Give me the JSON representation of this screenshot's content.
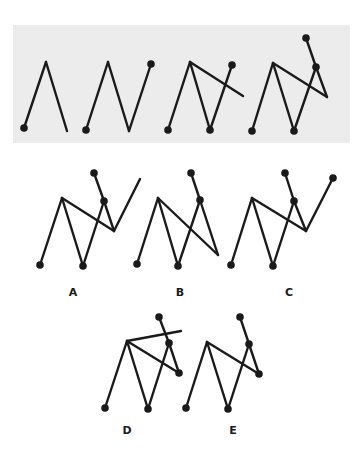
{
  "puzzle": {
    "type": "sequence-completion",
    "sequence_panel": {
      "background": "#ececec",
      "x": 13,
      "y": 25,
      "width": 337,
      "height": 118,
      "figures": [
        {
          "id": "step-1",
          "segments": [
            [
              24,
              128,
              46,
              62
            ],
            [
              46,
              62,
              67,
              131
            ]
          ],
          "dots": [
            [
              24,
              128
            ]
          ]
        },
        {
          "id": "step-2",
          "segments": [
            [
              86,
              130,
              108,
              62
            ],
            [
              108,
              62,
              129,
              131
            ],
            [
              129,
              131,
              151,
              64
            ]
          ],
          "dots": [
            [
              86,
              130
            ],
            [
              151,
              64
            ]
          ]
        },
        {
          "id": "step-3",
          "segments": [
            [
              168,
              130,
              190,
              62
            ],
            [
              190,
              62,
              210,
              130
            ],
            [
              210,
              130,
              232,
              65
            ],
            [
              190,
              62,
              243,
              96
            ]
          ],
          "dots": [
            [
              168,
              130
            ],
            [
              210,
              130
            ],
            [
              232,
              65
            ]
          ]
        },
        {
          "id": "step-4",
          "segments": [
            [
              252,
              131,
              273,
              63
            ],
            [
              273,
              63,
              294,
              131
            ],
            [
              294,
              131,
              316,
              67
            ],
            [
              273,
              63,
              327,
              97
            ],
            [
              327,
              97,
              316,
              67
            ],
            [
              316,
              67,
              306,
              38
            ]
          ],
          "dots": [
            [
              252,
              131
            ],
            [
              294,
              131
            ],
            [
              316,
              67
            ],
            [
              306,
              38
            ]
          ]
        }
      ]
    },
    "options": [
      {
        "label": "A",
        "label_pos": [
          73,
          287
        ],
        "segments": [
          [
            40,
            265,
            62,
            198
          ],
          [
            62,
            198,
            83,
            266
          ],
          [
            83,
            266,
            104,
            201
          ],
          [
            62,
            198,
            114,
            231
          ],
          [
            114,
            231,
            104,
            201
          ],
          [
            104,
            201,
            94,
            173
          ],
          [
            114,
            231,
            140,
            179
          ]
        ],
        "dots": [
          [
            40,
            265
          ],
          [
            83,
            266
          ],
          [
            104,
            201
          ],
          [
            94,
            173
          ]
        ]
      },
      {
        "label": "B",
        "label_pos": [
          180,
          287
        ],
        "segments": [
          [
            137,
            264,
            158,
            198
          ],
          [
            158,
            198,
            178,
            266
          ],
          [
            178,
            266,
            200,
            200
          ],
          [
            158,
            198,
            218,
            255
          ],
          [
            218,
            255,
            200,
            200
          ],
          [
            200,
            200,
            191,
            173
          ]
        ],
        "dots": [
          [
            137,
            264
          ],
          [
            178,
            266
          ],
          [
            200,
            200
          ],
          [
            191,
            173
          ]
        ]
      },
      {
        "label": "C",
        "label_pos": [
          289,
          287
        ],
        "segments": [
          [
            231,
            265,
            252,
            198
          ],
          [
            252,
            198,
            273,
            266
          ],
          [
            273,
            266,
            294,
            201
          ],
          [
            252,
            198,
            306,
            231
          ],
          [
            306,
            231,
            294,
            201
          ],
          [
            294,
            201,
            285,
            173
          ],
          [
            306,
            231,
            333,
            178
          ]
        ],
        "dots": [
          [
            231,
            265
          ],
          [
            273,
            266
          ],
          [
            294,
            201
          ],
          [
            285,
            173
          ],
          [
            333,
            178
          ]
        ]
      },
      {
        "label": "D",
        "label_pos": [
          127,
          425
        ],
        "segments": [
          [
            105,
            408,
            127,
            341
          ],
          [
            127,
            341,
            148,
            409
          ],
          [
            148,
            409,
            169,
            343
          ],
          [
            127,
            341,
            179,
            373
          ],
          [
            179,
            373,
            169,
            343
          ],
          [
            169,
            343,
            159,
            317
          ],
          [
            127,
            341,
            181,
            331
          ]
        ],
        "dots": [
          [
            105,
            408
          ],
          [
            148,
            409
          ],
          [
            169,
            343
          ],
          [
            179,
            373
          ],
          [
            159,
            317
          ]
        ]
      },
      {
        "label": "E",
        "label_pos": [
          233,
          425
        ],
        "segments": [
          [
            186,
            408,
            207,
            342
          ],
          [
            207,
            342,
            228,
            409
          ],
          [
            228,
            409,
            249,
            344
          ],
          [
            207,
            342,
            259,
            374
          ],
          [
            259,
            374,
            249,
            344
          ],
          [
            249,
            344,
            240,
            317
          ]
        ],
        "dots": [
          [
            186,
            408
          ],
          [
            228,
            409
          ],
          [
            249,
            344
          ],
          [
            259,
            374
          ],
          [
            240,
            317
          ]
        ]
      }
    ],
    "style": {
      "stroke_color": "#1a1a1a",
      "stroke_width": 2.4,
      "dot_radius": 3.8
    }
  }
}
